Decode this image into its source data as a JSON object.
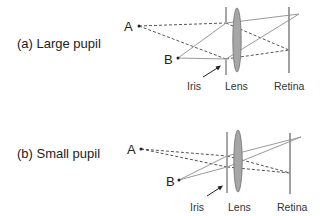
{
  "panels": [
    {
      "id": "a",
      "caption": "(a) Large pupil",
      "point_a_label": "A",
      "point_b_label": "B",
      "iris_label": "Iris",
      "lens_label": "Lens",
      "retina_label": "Retina",
      "pupil_size": "large"
    },
    {
      "id": "b",
      "caption": "(b) Small pupil",
      "point_a_label": "A",
      "point_b_label": "B",
      "iris_label": "Iris",
      "lens_label": "Lens",
      "retina_label": "Retina",
      "pupil_size": "small"
    }
  ],
  "colors": {
    "dashed_ray": "#555555",
    "solid_ray": "#9a9a9a",
    "lens_fill": "#a6a6a6",
    "structure": "#777777"
  }
}
